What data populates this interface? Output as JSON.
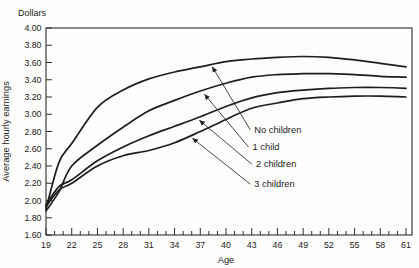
{
  "chart_data": {
    "type": "line",
    "unit_label": "Dollars",
    "xlabel": "Age",
    "ylabel": "Average hourly earnings",
    "x": [
      19,
      20.5,
      22,
      25,
      28,
      31,
      34,
      37,
      40,
      43,
      46,
      49,
      52,
      55,
      58,
      61
    ],
    "series": [
      {
        "name": "No children",
        "values": [
          1.9,
          2.44,
          2.66,
          3.08,
          3.28,
          3.41,
          3.49,
          3.55,
          3.61,
          3.64,
          3.66,
          3.67,
          3.66,
          3.63,
          3.59,
          3.55
        ]
      },
      {
        "name": "1 child",
        "values": [
          1.88,
          2.1,
          2.4,
          2.64,
          2.85,
          3.04,
          3.16,
          3.27,
          3.36,
          3.43,
          3.46,
          3.47,
          3.47,
          3.46,
          3.44,
          3.43
        ]
      },
      {
        "name": "2 children",
        "values": [
          1.95,
          2.16,
          2.24,
          2.46,
          2.62,
          2.75,
          2.86,
          2.97,
          3.09,
          3.19,
          3.25,
          3.28,
          3.3,
          3.31,
          3.31,
          3.3
        ]
      },
      {
        "name": "3 children",
        "values": [
          1.93,
          2.12,
          2.2,
          2.4,
          2.52,
          2.58,
          2.67,
          2.8,
          2.94,
          3.07,
          3.13,
          3.18,
          3.2,
          3.21,
          3.21,
          3.2
        ]
      }
    ],
    "ylim": [
      1.6,
      4.0
    ],
    "yticks": [
      "4.00",
      "3.80",
      "3.60",
      "3.40",
      "3.20",
      "3.00",
      "2.80",
      "2.60",
      "2.40",
      "2.20",
      "2.00",
      "1.80",
      "1.60"
    ],
    "xlim": [
      19,
      61.7
    ],
    "xticks": [
      19,
      22,
      25,
      28,
      31,
      34,
      37,
      40,
      43,
      46,
      49,
      52,
      55,
      58,
      61
    ],
    "x_minor_step": 1,
    "grid": false,
    "line_color": "#1e1e1e",
    "annotation_color": "#333333",
    "annotations": [
      {
        "label": "No children",
        "text_at": {
          "x": 43.3,
          "y": 2.82
        },
        "arrow_to": {
          "x": 38.4,
          "y": 3.55
        }
      },
      {
        "label": "1 child",
        "text_at": {
          "x": 43.1,
          "y": 2.62
        },
        "arrow_to": {
          "x": 37.5,
          "y": 3.23
        }
      },
      {
        "label": "2 children",
        "text_at": {
          "x": 43.5,
          "y": 2.42
        },
        "arrow_to": {
          "x": 36.9,
          "y": 2.93
        }
      },
      {
        "label": "3 children",
        "text_at": {
          "x": 43.3,
          "y": 2.19
        },
        "arrow_to": {
          "x": 36.1,
          "y": 2.72
        }
      }
    ]
  }
}
